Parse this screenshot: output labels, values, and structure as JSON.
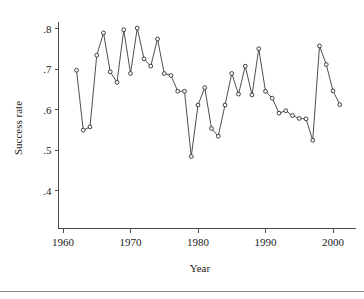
{
  "chart_data": {
    "type": "line",
    "title": "",
    "subtitle": "",
    "xlabel": "Year",
    "ylabel": "Success rate",
    "xlim": [
      1960.0,
      2002.5
    ],
    "ylim": [
      0.38,
      0.815
    ],
    "grid": false,
    "legend": null,
    "marker": "open-circle",
    "x_ticks": [
      1960,
      1970,
      1980,
      1990,
      2000
    ],
    "x_tick_labels": [
      "1960",
      "1970",
      "1980",
      "1990",
      "2000"
    ],
    "y_ticks": [
      0.4,
      0.5,
      0.6,
      0.7,
      0.8
    ],
    "y_tick_labels": [
      ".4",
      ".5",
      ".6",
      ".7",
      ".8"
    ],
    "x": [
      1962,
      1963,
      1964,
      1965,
      1966,
      1967,
      1968,
      1969,
      1970,
      1971,
      1972,
      1973,
      1974,
      1975,
      1976,
      1977,
      1978,
      1979,
      1980,
      1981,
      1982,
      1983,
      1984,
      1985,
      1986,
      1987,
      1988,
      1989,
      1990,
      1991,
      1992,
      1993,
      1994,
      1995,
      1996,
      1997,
      1998,
      1999,
      2000,
      2001
    ],
    "values": [
      0.697,
      0.549,
      0.557,
      0.734,
      0.789,
      0.693,
      0.667,
      0.797,
      0.689,
      0.801,
      0.725,
      0.707,
      0.774,
      0.689,
      0.684,
      0.645,
      0.645,
      0.484,
      0.611,
      0.654,
      0.553,
      0.534,
      0.611,
      0.689,
      0.638,
      0.707,
      0.636,
      0.75,
      0.645,
      0.628,
      0.591,
      0.597,
      0.585,
      0.578,
      0.577,
      0.524,
      0.757,
      0.711,
      0.646,
      0.612
    ],
    "categories": [
      "1962",
      "1963",
      "1964",
      "1965",
      "1966",
      "1967",
      "1968",
      "1969",
      "1970",
      "1971",
      "1972",
      "1973",
      "1974",
      "1975",
      "1976",
      "1977",
      "1978",
      "1979",
      "1980",
      "1981",
      "1982",
      "1983",
      "1984",
      "1985",
      "1986",
      "1987",
      "1988",
      "1989",
      "1990",
      "1991",
      "1992",
      "1993",
      "1994",
      "1995",
      "1996",
      "1997",
      "1998",
      "1999",
      "2000",
      "2001"
    ],
    "series": [
      {
        "name": "Success rate",
        "values": [
          0.697,
          0.549,
          0.557,
          0.734,
          0.789,
          0.693,
          0.667,
          0.797,
          0.689,
          0.801,
          0.725,
          0.707,
          0.774,
          0.689,
          0.684,
          0.645,
          0.645,
          0.484,
          0.611,
          0.654,
          0.553,
          0.534,
          0.611,
          0.689,
          0.638,
          0.707,
          0.636,
          0.75,
          0.645,
          0.628,
          0.591,
          0.597,
          0.585,
          0.578,
          0.577,
          0.524,
          0.757,
          0.711,
          0.646,
          0.612
        ]
      }
    ],
    "colors": {
      "line": "#3a3a3a",
      "marker_fill": "#ffffff",
      "marker_stroke": "#2b2b2b",
      "axis": "#4a4a4a",
      "text": "#1a1a1a",
      "background": "#ffffff",
      "rule": "#8a8a8a"
    }
  }
}
